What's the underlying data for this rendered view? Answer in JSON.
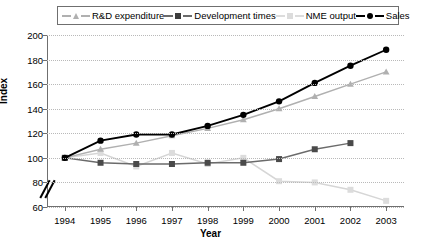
{
  "chart_data": {
    "type": "line",
    "title": "",
    "xlabel": "Year",
    "ylabel": "Index",
    "categories": [
      1994,
      1995,
      1996,
      1997,
      1998,
      1999,
      2000,
      2001,
      2002,
      2003
    ],
    "ylim": [
      60,
      200
    ],
    "ytick_step": 20,
    "yticks": [
      60,
      80,
      100,
      120,
      140,
      160,
      180,
      200
    ],
    "axis_break": "between 60 and 80",
    "grid": "horizontal dotted",
    "legend_position": "top",
    "series": [
      {
        "name": "R&D expenditure",
        "color": "#b0b0b0",
        "marker": "triangle",
        "values": [
          100,
          107,
          112,
          118,
          124,
          131,
          140,
          150,
          160,
          170
        ]
      },
      {
        "name": "Development times",
        "color": "#6b6b6b",
        "marker": "square",
        "values": [
          100,
          96,
          95,
          95,
          96,
          96,
          99,
          107,
          112,
          null
        ]
      },
      {
        "name": "NME output",
        "color": "#d6d6d6",
        "marker": "square",
        "values": [
          100,
          104,
          93,
          104,
          95,
          100,
          81,
          80,
          74,
          65
        ]
      },
      {
        "name": "Sales",
        "color": "#000000",
        "marker": "circle",
        "values": [
          100,
          114,
          119,
          119,
          126,
          135,
          146,
          161,
          175,
          188
        ]
      }
    ]
  },
  "legend": {
    "items": [
      {
        "label": "R&D expenditure"
      },
      {
        "label": "Development times"
      },
      {
        "label": "NME output"
      },
      {
        "label": "Sales"
      }
    ]
  },
  "axes": {
    "y_title": "Index",
    "x_title": "Year"
  }
}
